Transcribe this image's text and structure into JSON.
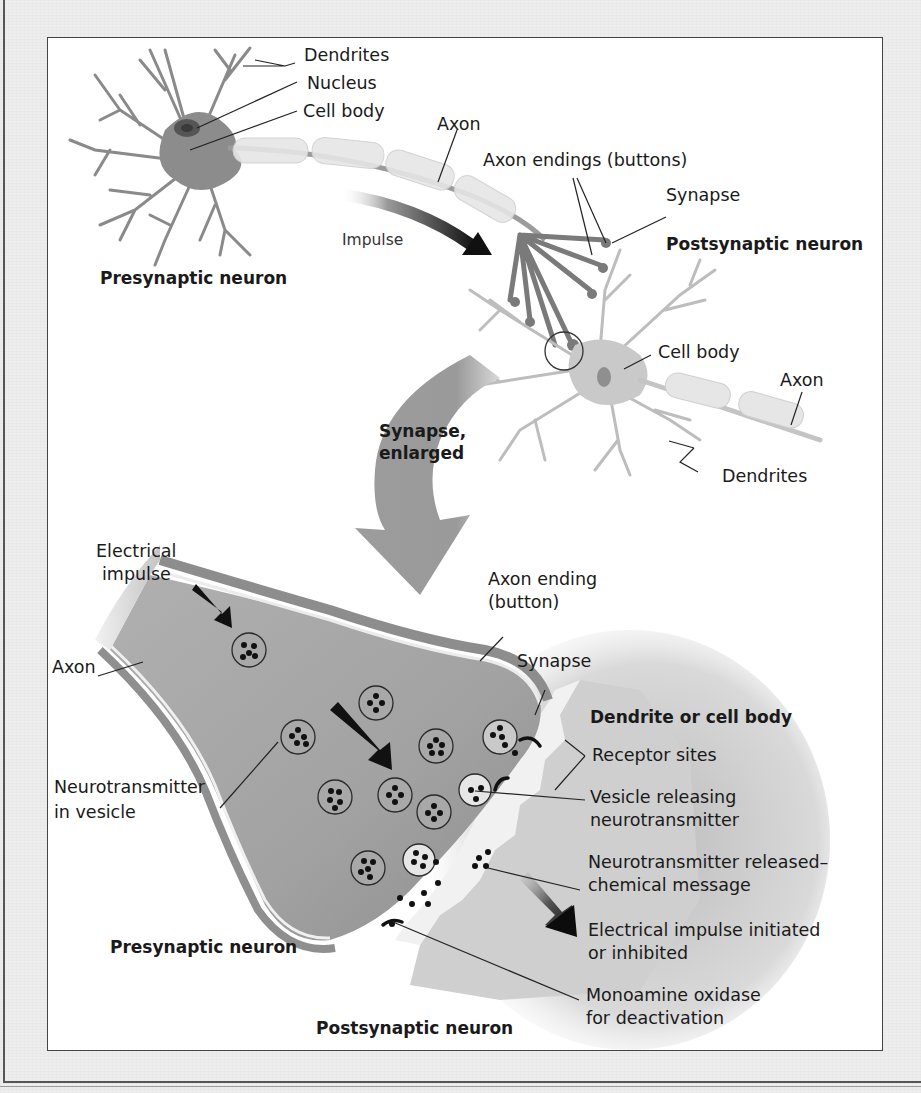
{
  "figure": {
    "type": "neuron-synapse-diagram",
    "colors": {
      "page_background": "#ededed",
      "frame_border": "#444444",
      "frame_background": "#ffffff",
      "neuron_fill": "#8a8a8a",
      "myelin_fill": "#e4e4e4",
      "arrow_dark": "#111111",
      "label_text": "#1a1a1a"
    }
  },
  "top_panel": {
    "presynaptic": {
      "title": "Presynaptic neuron",
      "labels": {
        "dendrites": "Dendrites",
        "nucleus": "Nucleus",
        "cell_body": "Cell body",
        "axon": "Axon",
        "impulse": "Impulse",
        "axon_endings": "Axon endings (buttons)",
        "synapse": "Synapse"
      }
    },
    "postsynaptic": {
      "title": "Postsynaptic neuron",
      "labels": {
        "cell_body": "Cell body",
        "axon": "Axon",
        "dendrites": "Dendrites"
      }
    },
    "enlarge_arrow_label_line1": "Synapse,",
    "enlarge_arrow_label_line2": "enlarged"
  },
  "bottom_panel": {
    "labels": {
      "electrical_impulse_line1": "Electrical",
      "electrical_impulse_line2": "impulse",
      "axon": "Axon",
      "axon_ending_line1": "Axon ending",
      "axon_ending_line2": "(button)",
      "synapse": "Synapse",
      "dendrite_or_cell_body": "Dendrite or cell body",
      "receptor_sites": "Receptor sites",
      "vesicle_releasing_line1": "Vesicle releasing",
      "vesicle_releasing_line2": "neurotransmitter",
      "nt_released_line1": "Neurotransmitter released–",
      "nt_released_line2": "chemical message",
      "impulse_initiated_line1": "Electrical impulse initiated",
      "impulse_initiated_line2": "or inhibited",
      "mao_line1": "Monoamine oxidase",
      "mao_line2": "for deactivation",
      "nt_in_vesicle_line1": "Neurotransmitter",
      "nt_in_vesicle_line2": "in vesicle",
      "presynaptic_neuron": "Presynaptic neuron",
      "postsynaptic_neuron": "Postsynaptic neuron"
    }
  }
}
